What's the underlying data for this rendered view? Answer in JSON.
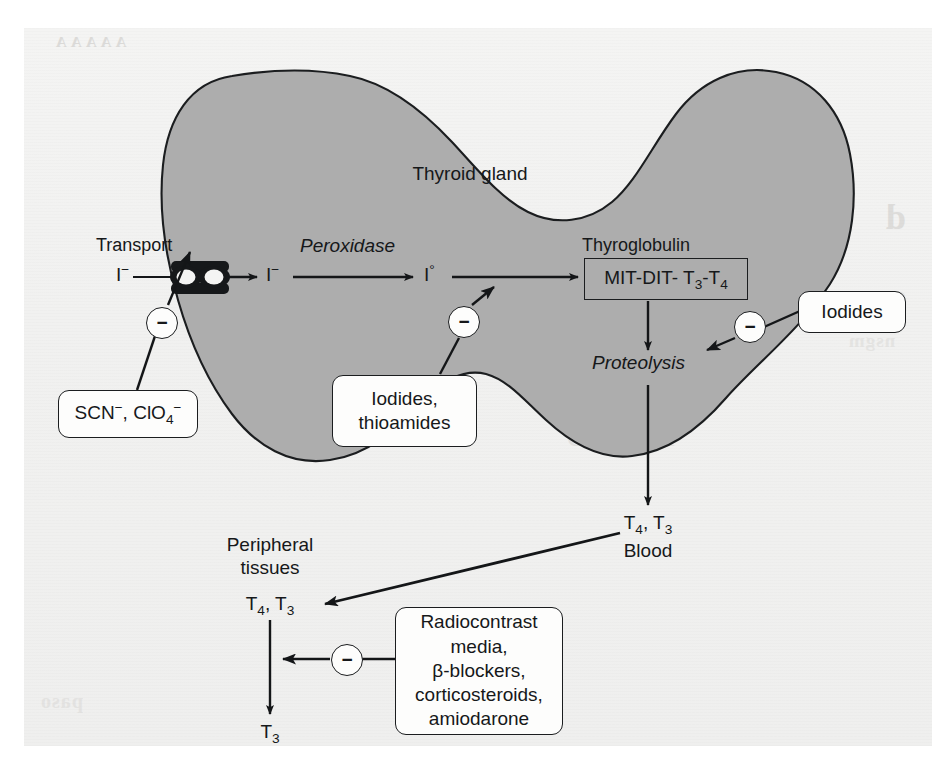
{
  "figure": {
    "gland_label": "Thyroid gland",
    "gland_fill": "#adadad",
    "stroke": "#1b1d1f",
    "paper": "#f1f1f0"
  },
  "labels": {
    "transport": "Transport",
    "iodide_out": "I",
    "iodide_out_charge": "−",
    "peroxidase": "Peroxidase",
    "iodide_in": "I",
    "iodide_in_charge": "−",
    "iodine_atom": "I",
    "iodine_atom_degree": "°",
    "thyroglobulin": "Thyroglobulin",
    "mit_dit_pre": "MIT-DIT- T",
    "mit_dit_sub1": "3",
    "mit_dit_mid": "-T",
    "mit_dit_sub2": "4",
    "proteolysis": "Proteolysis",
    "blood_t4t3_pre": "T",
    "blood_t4t3_sub1": "4",
    "blood_t4t3_mid": ", T",
    "blood_t4t3_sub2": "3",
    "blood": "Blood",
    "peripheral_line1": "Peripheral",
    "peripheral_line2": "tissues",
    "periph_t4t3_pre": "T",
    "periph_t4t3_sub1": "4",
    "periph_t4t3_mid": ", T",
    "periph_t4t3_sub2": "3",
    "t3_pre": "T",
    "t3_sub": "3"
  },
  "inhibitor_boxes": {
    "transport_blockers": {
      "text_pre": "SCN",
      "sup1": "−",
      "mid": ", ClO",
      "sub1": "4",
      "sup2": "−"
    },
    "organification_blockers": {
      "line1": "Iodides,",
      "line2": "thioamides"
    },
    "proteolysis_blockers": {
      "line1": "Iodides"
    },
    "peripheral_blockers": {
      "line1": "Radiocontrast",
      "line2": "media,",
      "line3": "β-blockers,",
      "line4": "corticosteroids,",
      "line5": "amiodarone"
    }
  },
  "inhibition_symbol": "−",
  "ghost_text": {
    "g1": "A A A A A",
    "g2": "d",
    "g3": "s",
    "g4": "HASTINGS",
    "g5": "MD, PhD",
    "g6": "nsgm",
    "g7": "paso"
  }
}
